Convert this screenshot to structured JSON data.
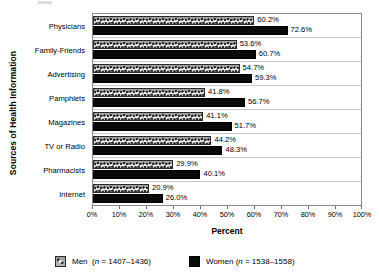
{
  "chart_data": {
    "type": "bar",
    "orientation": "horizontal",
    "title": "",
    "xlabel": "Percent",
    "ylabel": "Sources of Health Information",
    "xlim": [
      0,
      100
    ],
    "xtick_labels": [
      "0%",
      "10%",
      "20%",
      "30%",
      "40%",
      "50%",
      "60%",
      "70%",
      "80%",
      "90%",
      "100%"
    ],
    "xtick_values": [
      0,
      10,
      20,
      30,
      40,
      50,
      60,
      70,
      80,
      90,
      100
    ],
    "grid": false,
    "legend_position": "bottom",
    "categories": [
      "Physicians",
      "Family-Friends",
      "Advertising",
      "Pamphlets",
      "Magazines",
      "TV or Radio",
      "Pharmacists",
      "Internet"
    ],
    "series": [
      {
        "name": "Men",
        "n_label": "(n = 1407–1436)",
        "color": "#a8a8a8",
        "values": [
          60.2,
          53.6,
          54.7,
          41.8,
          41.1,
          44.2,
          29.9,
          20.9
        ],
        "value_labels": [
          "60.2%",
          "53.6%",
          "54.7%",
          "41.8%",
          "41.1%",
          "44.2%",
          "29.9%",
          "20.9%"
        ]
      },
      {
        "name": "Women",
        "n_label": "(n = 1538–1558)",
        "color": "#0a0a0a",
        "values": [
          72.6,
          60.7,
          59.3,
          56.7,
          51.7,
          48.3,
          40.1,
          26.0
        ],
        "value_labels": [
          "72.6%",
          "60.7%",
          "59.3%",
          "56.7%",
          "51.7%",
          "48.3%",
          "40.1%",
          "26.0%"
        ]
      }
    ]
  },
  "legend": {
    "men": {
      "name": "Men",
      "n_prefix": "n",
      "n_text": " = 1407–1436)",
      "open_paren": "("
    },
    "women": {
      "name": "Women",
      "n_prefix": "n",
      "n_text": " = 1538–1558)",
      "open_paren": "("
    }
  }
}
